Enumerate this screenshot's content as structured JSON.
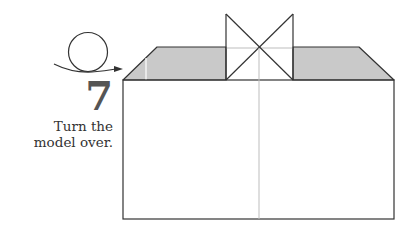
{
  "step": {
    "number": "7",
    "instruction_lines": [
      "Turn the",
      "model over."
    ]
  },
  "symbols": {
    "turn_over": "turn-over-arrow-icon"
  },
  "colors": {
    "line": "#333333",
    "crease": "#bdbdbd",
    "shade": "#c9c9c9",
    "number": "#555555",
    "background": "#ffffff"
  }
}
